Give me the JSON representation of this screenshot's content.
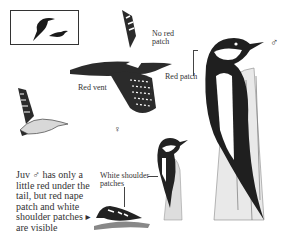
{
  "page": {
    "type": "field-guide-illustration"
  },
  "silhouette_box": {
    "icons": [
      "perched-bird-silhouette",
      "flying-bird-silhouette"
    ]
  },
  "labels": {
    "no_red_patch": "No red patch",
    "no_red_patch_line1": "No red",
    "no_red_patch_line2": "patch",
    "red_vent": "Red vent",
    "red_patch": "Red patch",
    "white_shoulder_line1": "White shoulder",
    "white_shoulder_line2": "patches"
  },
  "sex_symbols": {
    "male": "♂",
    "female": "♀"
  },
  "caption": {
    "lines": [
      "Juv ♂ has only a",
      "little red under the",
      "tail, but red nape",
      "patch and white",
      "shoulder patches ▸",
      "are visible"
    ]
  },
  "colors": {
    "ink": "#2a2a2a",
    "paper": "#ffffff",
    "gray": "#8a8a8a"
  }
}
